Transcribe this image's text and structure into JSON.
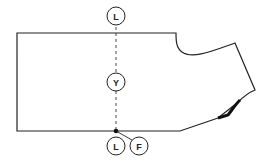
{
  "diagram": {
    "type": "garment pattern piece (sleeve/bodice block)",
    "colors": {
      "line": "#222222",
      "background": "#ffffff"
    },
    "markers": [
      {
        "id": "top-l",
        "label": "L",
        "cx": 116,
        "cy": 16
      },
      {
        "id": "mid-y",
        "label": "Y",
        "cx": 116,
        "cy": 82
      },
      {
        "id": "bottom-l",
        "label": "L",
        "cx": 116,
        "cy": 146
      },
      {
        "id": "bottom-f",
        "label": "F",
        "cx": 139,
        "cy": 146
      }
    ],
    "guide_line": {
      "style": "dashed",
      "x": 116,
      "y1": 27,
      "y2": 131
    },
    "pivot_point": {
      "x": 116,
      "y": 131
    }
  }
}
